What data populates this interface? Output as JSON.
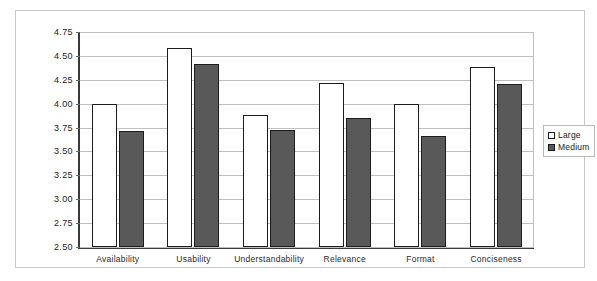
{
  "chart_data": {
    "type": "bar",
    "title": "",
    "xlabel": "",
    "ylabel": "",
    "ylim": [
      2.5,
      4.75
    ],
    "yticks": [
      "2.50",
      "2.75",
      "3.00",
      "3.25",
      "3.50",
      "3.75",
      "4.00",
      "4.25",
      "4.50",
      "4.75"
    ],
    "grid": true,
    "legend_position": "right",
    "categories": [
      "Availability",
      "Usability",
      "Understandability",
      "Relevance",
      "Format",
      "Conciseness"
    ],
    "series": [
      {
        "name": "Large",
        "values": [
          4.0,
          4.58,
          3.88,
          4.22,
          4.0,
          4.38
        ]
      },
      {
        "name": "Medium",
        "values": [
          3.71,
          4.42,
          3.72,
          3.85,
          3.66,
          4.21
        ]
      }
    ],
    "colors": {
      "large": "#ffffff",
      "medium": "#595959",
      "bar_border": "#1c1c1c",
      "gridline": "#c0c0c0",
      "axis": "#3a3a3a",
      "frame": "#c9c9c9"
    }
  },
  "legend": {
    "items": [
      {
        "label": "Large",
        "swatch": "hollow-square-icon"
      },
      {
        "label": "Medium",
        "swatch": "filled-square-icon"
      }
    ]
  }
}
